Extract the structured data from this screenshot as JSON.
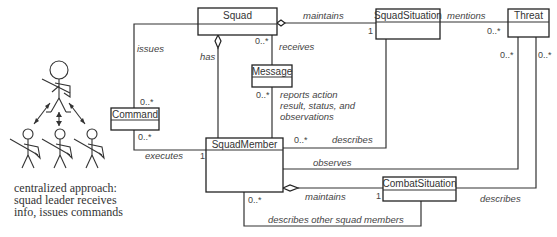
{
  "classes": {
    "squad": "Squad",
    "squad_situation": "SquadSituation",
    "threat": "Threat",
    "message": "Message",
    "command": "Command",
    "squad_member": "SquadMember",
    "combat_situation": "CombatSituation"
  },
  "associations": {
    "maintains_top": "maintains",
    "mentions": "mentions",
    "issues": "issues",
    "has": "has",
    "receives": "receives",
    "reports_line1": "reports action",
    "reports_line2": "result, status, and",
    "reports_line3": "observations",
    "describes_mid": "describes",
    "executes": "executes",
    "observes": "observes",
    "maintains_bottom": "maintains",
    "describes_right": "describes",
    "describes_others": "describes other squad members"
  },
  "multiplicities": {
    "squad_receives": "0..*",
    "squadsituation_one": "1",
    "threat_mentions": "0..*",
    "threat_left": "0..*",
    "threat_right": "0..*",
    "command_top": "0..*",
    "command_bottom": "0..*",
    "message_bottom": "0..*",
    "squadmember_describes": "0..*",
    "squadmember_executes": "1",
    "squadmember_bottom": "0..*",
    "combatsituation_one": "1"
  },
  "caption": {
    "line1": "centralized approach:",
    "line2": "squad leader receives",
    "line3": "info, issues commands"
  }
}
